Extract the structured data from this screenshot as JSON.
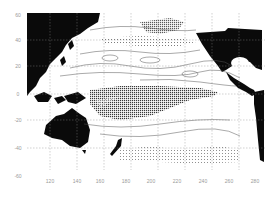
{
  "figure": {
    "type": "contour map",
    "region": "Pacific Ocean",
    "x_axis": {
      "unit": "degrees longitude (E)",
      "ticks": [
        "120",
        "140",
        "160",
        "180",
        "200",
        "220",
        "240",
        "260",
        "280"
      ]
    },
    "y_axis": {
      "unit": "degrees latitude",
      "ticks": [
        "60",
        "40",
        "20",
        "0",
        "-20",
        "-40",
        "-60"
      ]
    },
    "features": {
      "landmasses": [
        "Asia",
        "Australia",
        "New Zealand",
        "North America",
        "Central America",
        "South America"
      ],
      "shading": "dense contour band along the equatorial Pacific (~0 to -20 lat, 150-240 E) and a secondary band in the North Pacific (~40-50 N)"
    },
    "colors": {
      "land": "#0a0a0a",
      "ocean": "#ffffff",
      "contour": "#555555",
      "tick_text": "#9a9a9a"
    }
  }
}
